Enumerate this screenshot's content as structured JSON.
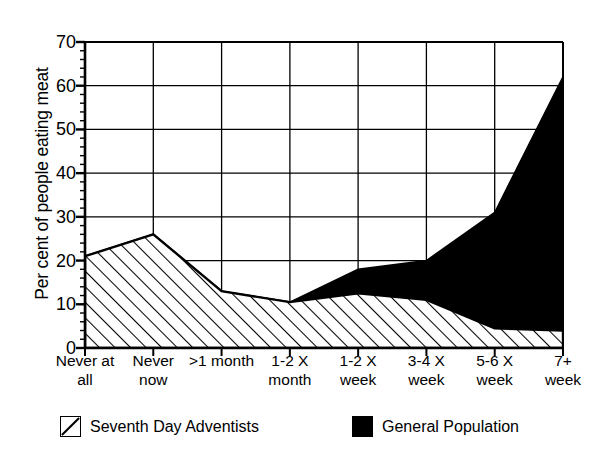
{
  "chart_data": {
    "type": "area",
    "title": "",
    "subtitle": "",
    "xlabel": "",
    "ylabel": "Per cent of people eating meat",
    "ylim": [
      0,
      70
    ],
    "ytick_values": [
      0,
      10,
      20,
      30,
      40,
      50,
      60,
      70
    ],
    "ytick_labels": [
      "0",
      "10",
      "20",
      "30",
      "40",
      "50",
      "60",
      "70"
    ],
    "minor_tick_step": 2,
    "grid": "major x and y gridlines",
    "legend_position": "below plot",
    "categories": [
      "Never at all",
      "Never now",
      ">1 month",
      "1-2 X month",
      "1-2 X week",
      "3-4 X week",
      "5-6 X week",
      "7+ week"
    ],
    "category_lines": [
      [
        "Never at",
        "all"
      ],
      [
        "Never",
        "now"
      ],
      [
        ">1 month",
        ""
      ],
      [
        "1-2 X",
        "month"
      ],
      [
        "1-2 X",
        "week"
      ],
      [
        "3-4 X",
        "week"
      ],
      [
        "5-6 X",
        "week"
      ],
      [
        "7+",
        "week"
      ]
    ],
    "series": [
      {
        "name": "Seventh Day Adventists",
        "fill": "hatched",
        "color": "#000000",
        "values": [
          21,
          26,
          13,
          10.5,
          12.5,
          11,
          4.5,
          4
        ]
      },
      {
        "name": "General Population",
        "fill": "solid",
        "color": "#000000",
        "values": [
          21,
          26,
          13,
          10.5,
          18,
          20,
          31,
          62
        ]
      }
    ]
  },
  "legend": {
    "entries": [
      {
        "label": "Seventh Day Adventists",
        "swatch": "hatched-swatch"
      },
      {
        "label": "General Population",
        "swatch": "solid-black-swatch"
      }
    ]
  }
}
